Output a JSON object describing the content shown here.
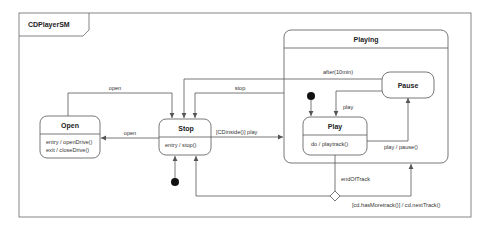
{
  "diagram": {
    "title": "CDPlayerSM",
    "composite_state": {
      "name": "Playing"
    },
    "states": {
      "open": {
        "name": "Open",
        "activities": [
          "entry / openDrive()",
          "exit / closeDrive()"
        ]
      },
      "stop": {
        "name": "Stop",
        "activities": [
          "entry / stop()"
        ]
      },
      "play": {
        "name": "Play",
        "activities": [
          "do / playtrack()"
        ]
      },
      "pause": {
        "name": "Pause"
      }
    },
    "transitions": {
      "stop_to_open": "open",
      "open_to_stop": "open",
      "playing_to_stop": "stop",
      "pause_to_stop": "after(10min)",
      "stop_to_play": "[CDinside()] play",
      "pause_to_play": "play",
      "play_to_pause": "play / pause()",
      "play_to_choice": "endOfTrack",
      "choice_to_playing": "[cd.hasMoretrack()] / cd.nextTrack()"
    },
    "colors": {
      "line": "#555555",
      "fill": "#ffffff",
      "initial": "#111111"
    }
  }
}
